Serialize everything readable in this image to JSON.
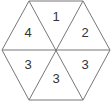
{
  "diagram": {
    "shape": "hexagon divided into 6 triangles",
    "triangles": [
      {
        "position": "top",
        "label": "1"
      },
      {
        "position": "top-right",
        "label": "2"
      },
      {
        "position": "bottom-right",
        "label": "3"
      },
      {
        "position": "bottom",
        "label": "3"
      },
      {
        "position": "bottom-left",
        "label": "3"
      },
      {
        "position": "top-left",
        "label": "4"
      }
    ]
  }
}
